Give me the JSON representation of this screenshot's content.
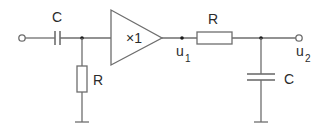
{
  "diagram": {
    "type": "circuit-schematic",
    "colors": {
      "wire": "#6e6e6e",
      "node_dot": "#1a1a1a",
      "text": "#2b2b2b",
      "background": "#ffffff"
    },
    "components": {
      "input_capacitor": {
        "label": "C"
      },
      "input_resistor": {
        "label": "R"
      },
      "buffer": {
        "label": "×1"
      },
      "output_resistor": {
        "label": "R"
      },
      "output_capacitor": {
        "label": "C"
      }
    },
    "nodes": {
      "u1": {
        "label": "u",
        "subscript": "1"
      },
      "u2": {
        "label": "u",
        "subscript": "2"
      }
    }
  }
}
